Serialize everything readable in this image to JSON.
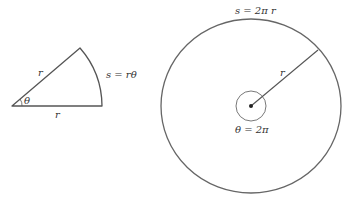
{
  "sector": {
    "radius_label": "r",
    "base_label": "r",
    "angle_label": "θ",
    "arc_label": "s = rθ"
  },
  "circle": {
    "arc_label": "s = 2π r",
    "radius_label": "r",
    "angle_label": "θ = 2π"
  },
  "colors": {
    "stroke": "#555555",
    "text": "#333333"
  }
}
